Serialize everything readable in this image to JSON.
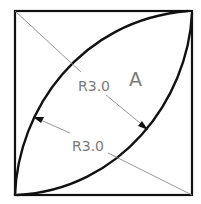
{
  "drawing": {
    "region_label": "A",
    "upper_dimension": "R3.0",
    "lower_dimension": "R3.0",
    "colors": {
      "outline": "#111111",
      "leader": "#8a8a8a",
      "text": "#7a7a7a"
    }
  }
}
